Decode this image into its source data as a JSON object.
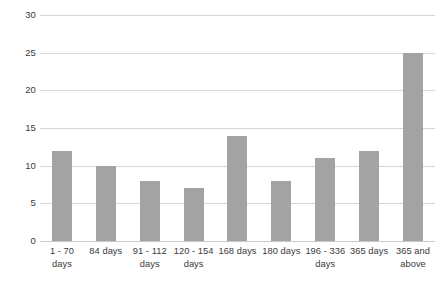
{
  "chart_data": {
    "type": "bar",
    "title": "",
    "subtitle": "",
    "xlabel": "",
    "ylabel": "",
    "categories": [
      "1 - 70 days",
      "84 days",
      "91 - 112 days",
      "120 - 154 days",
      "168 days",
      "180 days",
      "196 - 336 days",
      "365 days",
      "365 and above"
    ],
    "values": [
      12,
      10,
      8,
      7,
      14,
      8,
      11,
      12,
      25
    ],
    "ylim": [
      0,
      30
    ],
    "ytick_labels": [
      "0",
      "5",
      "10",
      "15",
      "20",
      "25",
      "30"
    ],
    "ytick_values": [
      0,
      5,
      10,
      15,
      20,
      25,
      30
    ],
    "grid": true,
    "legend": false,
    "legend_position": "none",
    "bar_color": "#a3a3a3",
    "gridline_color": "#d6d6d6",
    "background_color": "#ffffff",
    "text_color": "#3a3a3a"
  }
}
